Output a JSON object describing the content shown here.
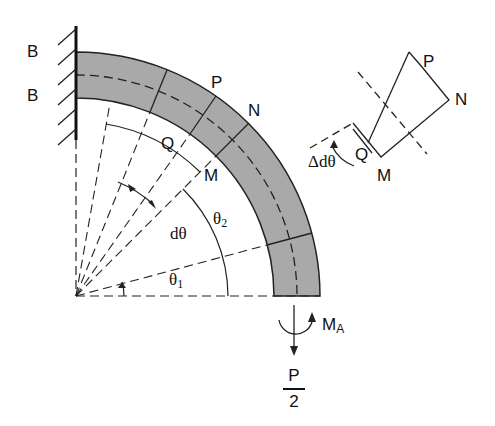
{
  "figure": {
    "labels": {
      "B_top": "B",
      "B_bottom": "B",
      "P": "P",
      "N": "N",
      "Q": "Q",
      "M": "M",
      "theta1_sym": "θ",
      "theta1_sub": "1",
      "theta2_sym": "θ",
      "theta2_sub": "2",
      "dtheta": "dθ",
      "M_A_main": "M",
      "M_A_sub": "A",
      "load_num": "P",
      "load_den": "2"
    },
    "inset": {
      "P": "P",
      "N": "N",
      "Q": "Q",
      "M": "M",
      "delta_dtheta": "Δdθ"
    },
    "colors": {
      "ring_fill": "#a9a9a9",
      "stroke": "#222222"
    }
  }
}
